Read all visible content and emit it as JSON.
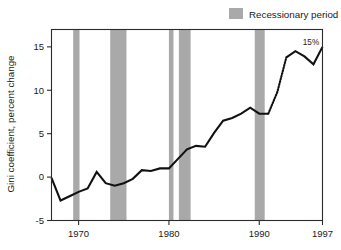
{
  "chart_data": {
    "type": "line",
    "title": "",
    "xlabel": "",
    "ylabel": "Gini coefficient, percent change",
    "xlim": [
      1967,
      1997
    ],
    "ylim": [
      -5,
      17
    ],
    "grid": false,
    "x_ticks": [
      1970,
      1980,
      1990,
      1997
    ],
    "x_tick_labels": [
      "1970",
      "1980",
      "1990",
      "1997"
    ],
    "y_ticks": [
      -5,
      0,
      5,
      10,
      15
    ],
    "y_tick_labels": [
      "-5",
      "0",
      "5",
      "10",
      "15"
    ],
    "legend": {
      "position": "top-right",
      "entries": [
        {
          "label": "Recessionary period",
          "color": "#a9a9a9",
          "marker": "square"
        }
      ]
    },
    "annotations": [
      {
        "text": "15%",
        "x": 1997,
        "y": 15,
        "placement": "above-left"
      }
    ],
    "series": [
      {
        "name": "Gini coefficient, percent change",
        "style": "solid",
        "color": "#111111",
        "x": [
          1967,
          1968,
          1969,
          1970,
          1971,
          1972,
          1973,
          1974,
          1975,
          1976,
          1977,
          1978,
          1979,
          1980,
          1981,
          1982,
          1983,
          1984,
          1985,
          1986,
          1987,
          1988,
          1989,
          1990,
          1991
        ],
        "y": [
          -0.1,
          -2.7,
          -2.2,
          -1.7,
          -1.3,
          0.6,
          -0.7,
          -1.0,
          -0.7,
          -0.2,
          0.8,
          0.7,
          1.0,
          1.0,
          2.1,
          3.2,
          3.6,
          3.5,
          5.1,
          6.5,
          6.8,
          7.3,
          8.0,
          7.3,
          7.3
        ]
      },
      {
        "name": "Gini coefficient, percent change (revised methodology)",
        "style": "dotted",
        "color": "#111111",
        "x": [
          1991,
          1992,
          1993
        ],
        "y": [
          7.3,
          9.8,
          13.8
        ]
      },
      {
        "name": "Gini coefficient, percent change (continued)",
        "style": "solid",
        "color": "#111111",
        "x": [
          1993,
          1994,
          1995,
          1996,
          1997
        ],
        "y": [
          13.8,
          14.5,
          13.9,
          13.0,
          15.0
        ]
      }
    ],
    "recession_bands": [
      {
        "start": 1969.4,
        "end": 1970.1,
        "color": "#a9a9a9"
      },
      {
        "start": 1973.5,
        "end": 1975.3,
        "color": "#a9a9a9"
      },
      {
        "start": 1980.0,
        "end": 1980.5,
        "color": "#a9a9a9"
      },
      {
        "start": 1981.1,
        "end": 1982.4,
        "color": "#a9a9a9"
      },
      {
        "start": 1989.5,
        "end": 1990.6,
        "color": "#a9a9a9"
      }
    ]
  }
}
